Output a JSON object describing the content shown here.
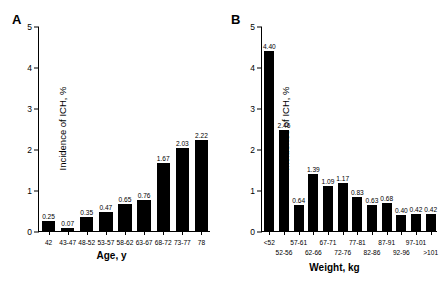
{
  "figure": {
    "panels": [
      {
        "letter": "A",
        "ylabel": "Incidence of ICH, %",
        "xlabel": "Age, y",
        "chart_data": {
          "type": "bar",
          "title": "",
          "xlabel": "Age, y",
          "ylabel": "Incidence of ICH, %",
          "ylim": [
            0,
            5
          ],
          "yticks": [
            0,
            1,
            2,
            3,
            4,
            5
          ],
          "grid": false,
          "legend": "none",
          "categories": [
            "42",
            "43-47",
            "48-52",
            "53-57",
            "58-62",
            "63-67",
            "68-72",
            "73-77",
            "78"
          ],
          "values": [
            0.25,
            0.07,
            0.35,
            0.47,
            0.65,
            0.76,
            1.67,
            2.03,
            2.22
          ],
          "value_labels": [
            "0.25",
            "0.07",
            "0.35",
            "0.47",
            "0.65",
            "0.76",
            "1.67",
            "2.03",
            "2.22"
          ]
        }
      },
      {
        "letter": "B",
        "ylabel": "Incidence of ICH, %",
        "xlabel": "Weight, kg",
        "chart_data": {
          "type": "bar",
          "title": "",
          "xlabel": "Weight, kg",
          "ylabel": "Incidence of ICH, %",
          "ylim": [
            0,
            5
          ],
          "yticks": [
            0,
            1,
            2,
            3,
            4,
            5
          ],
          "grid": false,
          "legend": "none",
          "categories": [
            "<52",
            "52-56",
            "57-61",
            "62-66",
            "67-71",
            "72-76",
            "77-81",
            "82-86",
            "87-91",
            "92-96",
            "97-101",
            ">101"
          ],
          "values": [
            4.4,
            2.46,
            0.64,
            1.39,
            1.09,
            1.17,
            0.83,
            0.63,
            0.68,
            0.4,
            0.42,
            0.42
          ],
          "value_labels": [
            "4.40",
            "2.46",
            "0.64",
            "1.39",
            "1.09",
            "1.17",
            "0.83",
            "0.63",
            "0.68",
            "0.40",
            "0.42",
            "0.42"
          ]
        }
      }
    ]
  }
}
